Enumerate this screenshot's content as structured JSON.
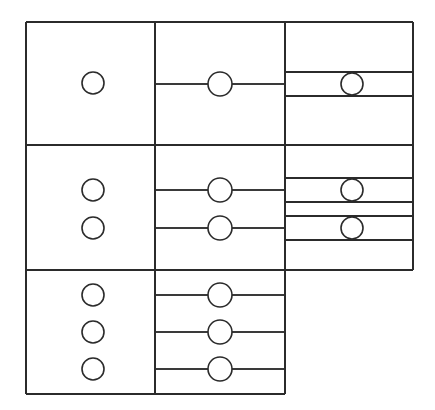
{
  "figure": {
    "background_color": "#ffffff",
    "line_color": "#2b2b2b",
    "node_fill_color": "#ffffff",
    "width": 435,
    "height": 410
  },
  "geometry": {
    "outer_left": 26,
    "outer_top": 22,
    "outer_right": 413,
    "outer_bottom": 394,
    "col1_left": 26,
    "col1_right": 155,
    "col2_left": 155,
    "col2_right": 285,
    "col3_left": 285,
    "col3_right": 413,
    "section_dividers": [
      145,
      270
    ],
    "col3_bottom": 270,
    "col2_bottom": 394,
    "col1_bottom": 394
  },
  "chart_data": {
    "type": "diagram",
    "columns": [
      {
        "index": 1,
        "name": "column-1",
        "x_left": 26,
        "x_right": 155,
        "y_top": 22,
        "y_bottom": 394,
        "node_count": 6
      },
      {
        "index": 2,
        "name": "column-2",
        "x_left": 155,
        "x_right": 285,
        "y_top": 22,
        "y_bottom": 394,
        "node_count": 6
      },
      {
        "index": 3,
        "name": "column-3",
        "x_left": 285,
        "x_right": 413,
        "y_top": 22,
        "y_bottom": 270,
        "node_count": 3
      }
    ],
    "sections": [
      {
        "index": 1,
        "name": "section-top",
        "y_top": 22,
        "y_bottom": 145,
        "col1_nodes": 1,
        "col2_nodes": 1,
        "col3_nodes": 1
      },
      {
        "index": 2,
        "name": "section-middle",
        "y_top": 145,
        "y_bottom": 270,
        "col1_nodes": 2,
        "col2_nodes": 2,
        "col3_nodes": 2
      },
      {
        "index": 3,
        "name": "section-bottom",
        "y_top": 270,
        "y_bottom": 394,
        "col1_nodes": 3,
        "col2_nodes": 3,
        "col3_nodes": 0
      }
    ],
    "nodes": [
      {
        "id": "c1-n1",
        "column": 1,
        "section": 1,
        "cx": 93,
        "cy": 83,
        "r": 11
      },
      {
        "id": "c1-n2",
        "column": 1,
        "section": 2,
        "cx": 93,
        "cy": 190,
        "r": 11
      },
      {
        "id": "c1-n3",
        "column": 1,
        "section": 2,
        "cx": 93,
        "cy": 228,
        "r": 11
      },
      {
        "id": "c1-n4",
        "column": 1,
        "section": 3,
        "cx": 93,
        "cy": 295,
        "r": 11
      },
      {
        "id": "c1-n5",
        "column": 1,
        "section": 3,
        "cx": 93,
        "cy": 332,
        "r": 11
      },
      {
        "id": "c1-n6",
        "column": 1,
        "section": 3,
        "cx": 93,
        "cy": 369,
        "r": 11
      },
      {
        "id": "c2-n1",
        "column": 2,
        "section": 1,
        "cx": 220,
        "cy": 84,
        "r": 12
      },
      {
        "id": "c2-n2",
        "column": 2,
        "section": 2,
        "cx": 220,
        "cy": 190,
        "r": 12
      },
      {
        "id": "c2-n3",
        "column": 2,
        "section": 2,
        "cx": 220,
        "cy": 228,
        "r": 12
      },
      {
        "id": "c2-n4",
        "column": 2,
        "section": 3,
        "cx": 220,
        "cy": 295,
        "r": 12
      },
      {
        "id": "c2-n5",
        "column": 2,
        "section": 3,
        "cx": 220,
        "cy": 332,
        "r": 12
      },
      {
        "id": "c2-n6",
        "column": 2,
        "section": 3,
        "cx": 220,
        "cy": 369,
        "r": 12
      },
      {
        "id": "c3-n1",
        "column": 3,
        "section": 1,
        "cx": 352,
        "cy": 84,
        "r": 11
      },
      {
        "id": "c3-n2",
        "column": 3,
        "section": 2,
        "cx": 352,
        "cy": 190,
        "r": 11
      },
      {
        "id": "c3-n3",
        "column": 3,
        "section": 2,
        "cx": 352,
        "cy": 228,
        "r": 11
      }
    ],
    "connector_lines": [
      {
        "id": "conn-c2-1",
        "column": 2,
        "y": 84,
        "x_start": 155,
        "x_end": 285
      },
      {
        "id": "conn-c2-2",
        "column": 2,
        "y": 190,
        "x_start": 155,
        "x_end": 285
      },
      {
        "id": "conn-c2-3",
        "column": 2,
        "y": 228,
        "x_start": 155,
        "x_end": 285
      },
      {
        "id": "conn-c2-4",
        "column": 2,
        "y": 295,
        "x_start": 155,
        "x_end": 285
      },
      {
        "id": "conn-c2-5",
        "column": 2,
        "y": 332,
        "x_start": 155,
        "x_end": 285
      },
      {
        "id": "conn-c2-6",
        "column": 2,
        "y": 369,
        "x_start": 155,
        "x_end": 285
      }
    ],
    "band_lines": [
      {
        "id": "band-c3-1-top",
        "column": 3,
        "y": 72,
        "x_start": 285,
        "x_end": 413
      },
      {
        "id": "band-c3-1-bottom",
        "column": 3,
        "y": 96,
        "x_start": 285,
        "x_end": 413
      },
      {
        "id": "band-c3-2-top",
        "column": 3,
        "y": 178,
        "x_start": 285,
        "x_end": 413
      },
      {
        "id": "band-c3-2-bottom",
        "column": 3,
        "y": 202,
        "x_start": 285,
        "x_end": 413
      },
      {
        "id": "band-c3-3-top",
        "column": 3,
        "y": 216,
        "x_start": 285,
        "x_end": 413
      },
      {
        "id": "band-c3-3-bottom",
        "column": 3,
        "y": 240,
        "x_start": 285,
        "x_end": 413
      }
    ]
  }
}
